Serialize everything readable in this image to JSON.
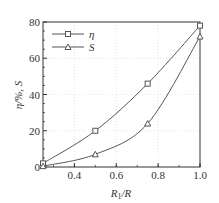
{
  "chart_data": {
    "type": "line",
    "title": "",
    "xlabel": "R1/R",
    "xlabel_main": "R",
    "xlabel_sub": "1",
    "xlabel_tail": "/R",
    "ylabel": "η/%, S",
    "xlim": [
      0.25,
      1.0
    ],
    "ylim": [
      0,
      80
    ],
    "xticks": [
      0.4,
      0.6,
      0.8,
      1.0
    ],
    "xtick_labels": [
      "0.4",
      "0.6",
      "0.8",
      "1.0"
    ],
    "yticks": [
      0,
      20,
      40,
      60,
      80
    ],
    "ytick_labels": [
      "0",
      "20",
      "40",
      "60",
      "80"
    ],
    "grid": true,
    "legend_position": "upper left",
    "x": [
      0.25,
      0.5,
      0.75,
      1.0
    ],
    "series": [
      {
        "name": "η",
        "marker": "square",
        "values": [
          2,
          20,
          46,
          78
        ]
      },
      {
        "name": "S",
        "marker": "triangle",
        "values": [
          0.5,
          7,
          24,
          72
        ]
      }
    ]
  },
  "colors": {
    "line": "#555555",
    "axis": "#333333",
    "grid": "#d8d8d8"
  }
}
